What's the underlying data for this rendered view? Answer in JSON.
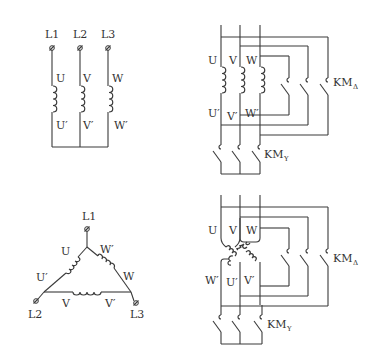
{
  "diagram": {
    "type": "star-delta starting wiring diagrams",
    "panels": [
      {
        "id": "star-connection",
        "terminals": [
          "L1",
          "L2",
          "L3"
        ],
        "windings": [
          {
            "start": "U",
            "end": "U′"
          },
          {
            "start": "V",
            "end": "V′"
          },
          {
            "start": "W",
            "end": "W′"
          }
        ]
      },
      {
        "id": "star-contactor-wiring",
        "winding_labels": [
          "U",
          "V",
          "W",
          "U′",
          "V′",
          "W′"
        ],
        "contactors": [
          {
            "name": "KM",
            "sub": "Δ"
          },
          {
            "name": "KM",
            "sub": "Y"
          }
        ]
      },
      {
        "id": "delta-connection",
        "terminals": [
          "L1",
          "L2",
          "L3"
        ],
        "winding_labels": [
          "U",
          "U′",
          "V",
          "V′",
          "W",
          "W′"
        ]
      },
      {
        "id": "delta-contactor-wiring",
        "winding_labels": [
          "U",
          "V",
          "W",
          "W′",
          "U′",
          "V′"
        ],
        "contactors": [
          {
            "name": "KM",
            "sub": "Δ"
          },
          {
            "name": "KM",
            "sub": "Y"
          }
        ]
      }
    ]
  },
  "labels": {
    "L1": "L1",
    "L2": "L2",
    "L3": "L3",
    "U": "U",
    "V": "V",
    "W": "W",
    "Up": "U′",
    "Vp": "V′",
    "Wp": "W′",
    "KM": "KM",
    "delta": "Δ",
    "Y": "Y"
  }
}
